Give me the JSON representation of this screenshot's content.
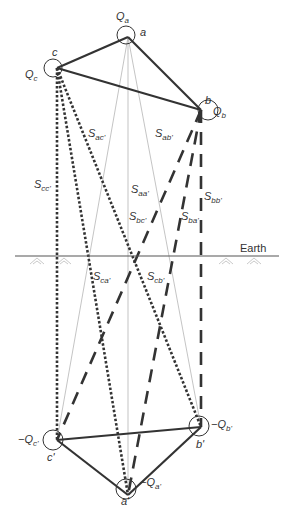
{
  "diagram": {
    "earth_label": "Earth",
    "colors": {
      "line": "#333333",
      "thin": "#999999",
      "hatch": "#bbbbbb",
      "text": "#333333"
    },
    "conductors": [
      {
        "id": "a",
        "charge": "Q",
        "charge_sub": "a",
        "label": "a"
      },
      {
        "id": "b",
        "charge": "Q",
        "charge_sub": "b",
        "label": "b"
      },
      {
        "id": "c",
        "charge": "Q",
        "charge_sub": "c",
        "label": "c"
      }
    ],
    "images": [
      {
        "id": "a'",
        "charge": "−Q",
        "charge_sub": "a'",
        "label": "a'"
      },
      {
        "id": "b'",
        "charge": "−Q",
        "charge_sub": "b'",
        "label": "b'"
      },
      {
        "id": "c'",
        "charge": "−Q",
        "charge_sub": "c'",
        "label": "c'"
      }
    ],
    "distances": [
      {
        "S": "S",
        "sub": "ac'"
      },
      {
        "S": "S",
        "sub": "ab'"
      },
      {
        "S": "S",
        "sub": "cc'"
      },
      {
        "S": "S",
        "sub": "aa'"
      },
      {
        "S": "S",
        "sub": "bb'"
      },
      {
        "S": "S",
        "sub": "bc'"
      },
      {
        "S": "S",
        "sub": "ba'"
      },
      {
        "S": "S",
        "sub": "ca'"
      },
      {
        "S": "S",
        "sub": "cb'"
      }
    ]
  }
}
